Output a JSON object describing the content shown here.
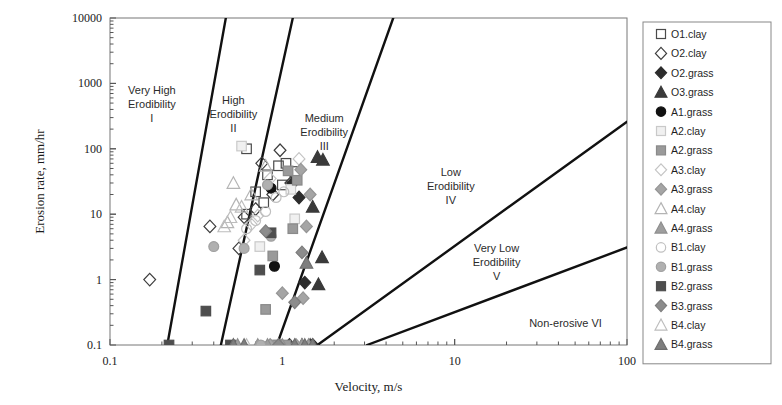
{
  "chart_data": {
    "type": "scatter",
    "title": "",
    "xlabel": "Velocity, m/s",
    "ylabel": "Erosion rate, mm/hr",
    "xscale": "log",
    "yscale": "log",
    "xlim": [
      0.1,
      100
    ],
    "ylim": [
      0.1,
      10000
    ],
    "xticks": [
      "0.1",
      "1",
      "10",
      "100"
    ],
    "yticks": [
      "0.1",
      "1",
      "10",
      "100",
      "1000",
      "10000"
    ],
    "grid": false,
    "legend_position": "right-outside",
    "annotations": [
      {
        "name": "region-1",
        "lines": [
          "Very High",
          "Erodibility",
          "I"
        ],
        "x": 0.175,
        "y": 700
      },
      {
        "name": "region-2",
        "lines": [
          "High",
          "Erodibility",
          "II"
        ],
        "x": 0.52,
        "y": 480
      },
      {
        "name": "region-3",
        "lines": [
          "Medium",
          "Erodibility",
          "III"
        ],
        "x": 1.75,
        "y": 260
      },
      {
        "name": "region-4",
        "lines": [
          "Low",
          "Erodibility",
          "IV"
        ],
        "x": 9.5,
        "y": 38
      },
      {
        "name": "region-5",
        "lines": [
          "Very Low",
          "Erodibility",
          "V"
        ],
        "x": 17.5,
        "y": 2.6
      },
      {
        "name": "region-6",
        "lines": [
          "Non-erosive VI"
        ],
        "x": 44,
        "y": 0.19
      }
    ],
    "boundary_lines": [
      {
        "name": "boundary-I-II",
        "p1": [
          0.215,
          0.1
        ],
        "p2": [
          0.47,
          10000
        ]
      },
      {
        "name": "boundary-II-III",
        "p1": [
          0.44,
          0.1
        ],
        "p2": [
          1.15,
          10000
        ]
      },
      {
        "name": "boundary-III-IV",
        "p1": [
          0.93,
          0.1
        ],
        "p2": [
          4.4,
          10000
        ]
      },
      {
        "name": "boundary-IV-V",
        "p1": [
          1.6,
          0.1
        ],
        "p2": [
          100,
          260
        ]
      },
      {
        "name": "boundary-V-VI",
        "p1": [
          3.1,
          0.1
        ],
        "p2": [
          100,
          3.1
        ]
      }
    ],
    "series": [
      {
        "name": "O1.clay",
        "marker": "square",
        "fill": "none",
        "stroke": "#4a4a4a",
        "points": [
          [
            0.62,
            100
          ],
          [
            0.82,
            40
          ],
          [
            0.7,
            22
          ],
          [
            0.78,
            15
          ],
          [
            0.62,
            10
          ],
          [
            0.95,
            55
          ],
          [
            1.05,
            60
          ],
          [
            1.18,
            45
          ],
          [
            1.0,
            28
          ]
        ]
      },
      {
        "name": "O2.clay",
        "marker": "diamond",
        "fill": "none",
        "stroke": "#3d3d3d",
        "points": [
          [
            0.17,
            1.0
          ],
          [
            0.38,
            6.5
          ],
          [
            0.6,
            9.0
          ],
          [
            0.76,
            60
          ],
          [
            0.97,
            95
          ],
          [
            0.7,
            12
          ],
          [
            0.56,
            3.0
          ],
          [
            0.88,
            20
          ],
          [
            1.12,
            30
          ]
        ]
      },
      {
        "name": "O2.grass",
        "marker": "diamond",
        "fill": "#2c2c2c",
        "stroke": "#2c2c2c",
        "points": [
          [
            1.35,
            0.9
          ],
          [
            1.15,
            30
          ],
          [
            1.25,
            18
          ],
          [
            1.5,
            0.1
          ],
          [
            1.1,
            0.1
          ]
        ]
      },
      {
        "name": "O3.grass",
        "marker": "triangle",
        "fill": "#3a3a3a",
        "stroke": "#3a3a3a",
        "points": [
          [
            1.6,
            75
          ],
          [
            1.72,
            68
          ],
          [
            1.5,
            13
          ],
          [
            1.7,
            2.2
          ],
          [
            1.62,
            0.85
          ],
          [
            1.45,
            0.1
          ],
          [
            1.3,
            0.1
          ]
        ]
      },
      {
        "name": "A1.grass",
        "marker": "circle",
        "fill": "#111111",
        "stroke": "#111111",
        "points": [
          [
            0.9,
            1.6
          ],
          [
            0.86,
            25
          ],
          [
            0.98,
            0.1
          ]
        ]
      },
      {
        "name": "A2.clay",
        "marker": "square",
        "fill": "#f0f0f0",
        "stroke": "#c9c9c9",
        "points": [
          [
            0.58,
            110
          ],
          [
            1.12,
            24
          ],
          [
            1.18,
            8.5
          ],
          [
            0.74,
            3.2
          ],
          [
            0.95,
            0.1
          ]
        ]
      },
      {
        "name": "A2.grass",
        "marker": "square",
        "fill": "#9a9a9a",
        "stroke": "#8a8a8a",
        "points": [
          [
            1.08,
            46
          ],
          [
            1.22,
            33
          ],
          [
            1.15,
            6.0
          ],
          [
            0.88,
            2.3
          ],
          [
            0.8,
            0.35
          ],
          [
            1.05,
            0.1
          ],
          [
            0.92,
            0.1
          ]
        ]
      },
      {
        "name": "A3.clay",
        "marker": "diamond",
        "fill": "none",
        "stroke": "#c4c4c4",
        "points": [
          [
            0.72,
            9.5
          ],
          [
            0.66,
            7.0
          ],
          [
            0.85,
            35
          ],
          [
            1.25,
            70
          ],
          [
            0.6,
            4.0
          ]
        ]
      },
      {
        "name": "A3.grass",
        "marker": "diamond",
        "fill": "#a5a5a5",
        "stroke": "#959595",
        "points": [
          [
            1.28,
            48
          ],
          [
            1.45,
            20
          ],
          [
            1.38,
            6.5
          ],
          [
            1.0,
            0.62
          ],
          [
            1.32,
            0.52
          ],
          [
            1.2,
            0.1
          ],
          [
            0.85,
            0.1
          ]
        ]
      },
      {
        "name": "A4.clay",
        "marker": "triangle",
        "fill": "none",
        "stroke": "#b4b4b4",
        "points": [
          [
            0.52,
            30
          ],
          [
            0.54,
            14
          ],
          [
            0.48,
            7.5
          ],
          [
            0.8,
            55
          ],
          [
            0.66,
            20
          ]
        ]
      },
      {
        "name": "A4.grass",
        "marker": "triangle",
        "fill": "#9e9e9e",
        "stroke": "#8e8e8e",
        "points": [
          [
            0.52,
            0.1
          ],
          [
            0.55,
            0.1
          ],
          [
            0.72,
            0.1
          ],
          [
            0.82,
            0.1
          ],
          [
            1.0,
            0.1
          ],
          [
            1.3,
            0.1
          ],
          [
            1.42,
            0.1
          ]
        ]
      },
      {
        "name": "B1.clay",
        "marker": "circle",
        "fill": "none",
        "stroke": "#c0c0c0",
        "points": [
          [
            0.7,
            8.0
          ],
          [
            0.62,
            6.0
          ],
          [
            0.92,
            18
          ],
          [
            1.02,
            22
          ],
          [
            0.8,
            11
          ]
        ]
      },
      {
        "name": "B1.grass",
        "marker": "circle",
        "fill": "#b0b0b0",
        "stroke": "#a0a0a0",
        "points": [
          [
            0.4,
            3.2
          ],
          [
            0.6,
            3.0
          ],
          [
            0.86,
            4.6
          ],
          [
            0.82,
            28
          ],
          [
            0.75,
            0.1
          ]
        ]
      },
      {
        "name": "B2.grass",
        "marker": "square",
        "fill": "#4e4e4e",
        "stroke": "#4e4e4e",
        "points": [
          [
            0.36,
            0.33
          ],
          [
            0.74,
            1.4
          ],
          [
            0.86,
            5.2
          ],
          [
            0.22,
            0.1
          ],
          [
            0.5,
            0.1
          ]
        ]
      },
      {
        "name": "B3.grass",
        "marker": "diamond",
        "fill": "#8c8c8c",
        "stroke": "#7c7c7c",
        "points": [
          [
            0.8,
            5.5
          ],
          [
            1.3,
            2.6
          ],
          [
            1.18,
            0.45
          ],
          [
            0.95,
            0.1
          ]
        ]
      },
      {
        "name": "B4.clay",
        "marker": "triangle",
        "fill": "none",
        "stroke": "#bdbdbd",
        "points": [
          [
            0.5,
            9.0
          ],
          [
            0.46,
            6.5
          ],
          [
            0.58,
            13
          ],
          [
            0.62,
            0.1
          ]
        ]
      },
      {
        "name": "B4.grass",
        "marker": "triangle",
        "fill": "#7e7e7e",
        "stroke": "#6e6e6e",
        "points": [
          [
            1.38,
            1.8
          ],
          [
            1.5,
            0.1
          ],
          [
            1.18,
            0.1
          ],
          [
            0.6,
            0.1
          ],
          [
            0.52,
            0.1
          ],
          [
            1.35,
            0.1
          ]
        ]
      }
    ]
  },
  "legend": {
    "items": [
      {
        "label": "O1.clay",
        "marker": "square",
        "fill": "none",
        "stroke": "#4a4a4a"
      },
      {
        "label": "O2.clay",
        "marker": "diamond",
        "fill": "none",
        "stroke": "#3d3d3d"
      },
      {
        "label": "O2.grass",
        "marker": "diamond",
        "fill": "#2c2c2c",
        "stroke": "#2c2c2c"
      },
      {
        "label": "O3.grass",
        "marker": "triangle",
        "fill": "#3a3a3a",
        "stroke": "#3a3a3a"
      },
      {
        "label": "A1.grass",
        "marker": "circle",
        "fill": "#111111",
        "stroke": "#111111"
      },
      {
        "label": "A2.clay",
        "marker": "square",
        "fill": "#f0f0f0",
        "stroke": "#c9c9c9"
      },
      {
        "label": "A2.grass",
        "marker": "square",
        "fill": "#9a9a9a",
        "stroke": "#8a8a8a"
      },
      {
        "label": "A3.clay",
        "marker": "diamond",
        "fill": "none",
        "stroke": "#c4c4c4"
      },
      {
        "label": "A3.grass",
        "marker": "diamond",
        "fill": "#a5a5a5",
        "stroke": "#959595"
      },
      {
        "label": "A4.clay",
        "marker": "triangle",
        "fill": "none",
        "stroke": "#b4b4b4"
      },
      {
        "label": "A4.grass",
        "marker": "triangle",
        "fill": "#9e9e9e",
        "stroke": "#8e8e8e"
      },
      {
        "label": "B1.clay",
        "marker": "circle",
        "fill": "none",
        "stroke": "#c0c0c0"
      },
      {
        "label": "B1.grass",
        "marker": "circle",
        "fill": "#b0b0b0",
        "stroke": "#a0a0a0"
      },
      {
        "label": "B2.grass",
        "marker": "square",
        "fill": "#4e4e4e",
        "stroke": "#4e4e4e"
      },
      {
        "label": "B3.grass",
        "marker": "diamond",
        "fill": "#8c8c8c",
        "stroke": "#7c7c7c"
      },
      {
        "label": "B4.clay",
        "marker": "triangle",
        "fill": "none",
        "stroke": "#bdbdbd"
      },
      {
        "label": "B4.grass",
        "marker": "triangle",
        "fill": "#7e7e7e",
        "stroke": "#6e6e6e"
      }
    ]
  },
  "colors": {
    "axis": "#555555",
    "frame": "#777777",
    "boundary": "#111111",
    "text": "#1a1a1a",
    "background": "#ffffff"
  }
}
